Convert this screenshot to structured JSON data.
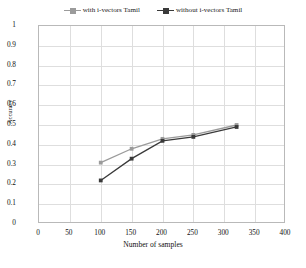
{
  "chart_data": {
    "type": "line",
    "title": "",
    "xlabel": "Number of samples",
    "ylabel": "Accuracy",
    "xlim": [
      0,
      400
    ],
    "ylim": [
      0,
      1
    ],
    "xticks": [
      "0",
      "50",
      "100",
      "150",
      "200",
      "250",
      "300",
      "350",
      "400"
    ],
    "xtick_values": [
      0,
      50,
      100,
      150,
      200,
      250,
      300,
      350,
      400
    ],
    "yticks": [
      "0",
      "0.1",
      "0.2",
      "0.3",
      "0.4",
      "0.5",
      "0.6",
      "0.7",
      "0.8",
      "0.9",
      "1"
    ],
    "ytick_values": [
      0,
      0.1,
      0.2,
      0.3,
      0.4,
      0.5,
      0.6,
      0.7,
      0.8,
      0.9,
      1
    ],
    "grid": true,
    "legend_position": "top",
    "x": [
      100,
      150,
      200,
      250,
      320
    ],
    "series": [
      {
        "name": "with i-vectors Tamil",
        "color": "#9b9b9b",
        "marker": "square",
        "x": [
          100,
          150,
          200,
          250,
          320
        ],
        "values": [
          0.31,
          0.38,
          0.43,
          0.45,
          0.5
        ]
      },
      {
        "name": "without i-vectors Tamil",
        "color": "#3a3a3a",
        "marker": "square",
        "x": [
          100,
          150,
          200,
          250,
          320
        ],
        "values": [
          0.22,
          0.33,
          0.42,
          0.44,
          0.49
        ]
      }
    ]
  },
  "legend": {
    "items": [
      {
        "label": "with i-vectors Tamil",
        "color": "#9b9b9b"
      },
      {
        "label": "without i-vectors Tamil",
        "color": "#3a3a3a"
      }
    ]
  },
  "axes": {
    "x_title": "Number of samples",
    "y_title": "Accuracy"
  },
  "colors": {
    "series_1": "#9b9b9b",
    "series_2": "#3a3a3a",
    "grid": "#dedede",
    "frame": "#b9b9b9",
    "background": "#ffffff"
  }
}
